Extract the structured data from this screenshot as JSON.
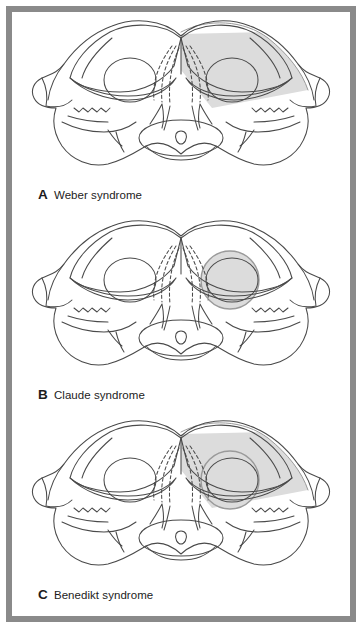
{
  "figure": {
    "kind": "midbrain-cross-section-lesion-diagram",
    "border_color": "#8a8a8a",
    "background_color": "#ffffff",
    "outline_color": "#4a4a4a",
    "lesion_fill_color": "#dcdcdc",
    "lesion_edge_color": "#9a9a9a"
  },
  "panels": [
    {
      "letter": "A",
      "title": "Weber syndrome",
      "lesion_regions": [
        "cerebral peduncle",
        "crus cerebri"
      ],
      "lesion_side": "right",
      "lesion_shapes": [
        "wedge"
      ]
    },
    {
      "letter": "B",
      "title": "Claude syndrome",
      "lesion_regions": [
        "red nucleus",
        "oculomotor fascicles"
      ],
      "lesion_side": "right",
      "lesion_shapes": [
        "circle"
      ]
    },
    {
      "letter": "C",
      "title": "Benedikt syndrome",
      "lesion_regions": [
        "cerebral peduncle",
        "red nucleus",
        "oculomotor fascicles"
      ],
      "lesion_side": "right",
      "lesion_shapes": [
        "wedge",
        "circle"
      ]
    }
  ]
}
